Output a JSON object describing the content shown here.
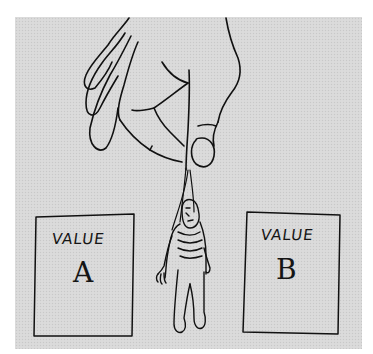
{
  "illustration": {
    "description": "Hand dangling a puppet-like figure on a string between two cards",
    "cards": [
      {
        "label": "VALUE",
        "letter": "A"
      },
      {
        "label": "VALUE",
        "letter": "B"
      }
    ],
    "background_color": "#d9d9d9",
    "ink_color": "#111111"
  }
}
